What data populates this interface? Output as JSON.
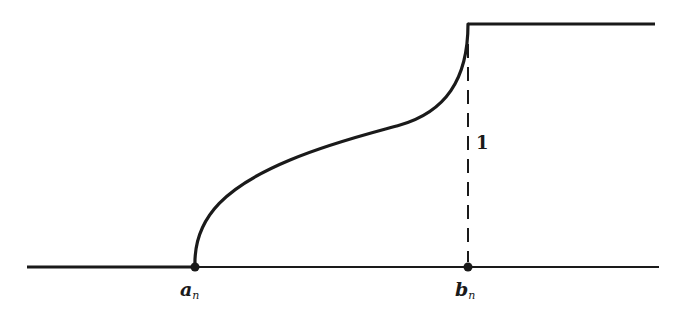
{
  "figure": {
    "colors": {
      "ink": "#1a1a1a",
      "background": "#ffffff"
    },
    "labels": {
      "a": {
        "main": "a",
        "sub": "n"
      },
      "b": {
        "main": "b",
        "sub": "n"
      },
      "jump": "1"
    },
    "curve": {
      "start_value": 0,
      "end_value": 1,
      "shape": "s-shaped, vertical tangent at both ends",
      "left_level": 0,
      "right_level": 1
    }
  }
}
